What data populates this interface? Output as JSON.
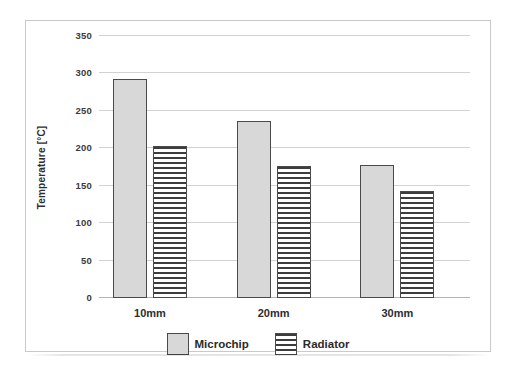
{
  "chart_data": {
    "type": "bar",
    "title": "",
    "xlabel": "",
    "ylabel": "Temperature [°C]",
    "categories": [
      "10mm",
      "20mm",
      "30mm"
    ],
    "series": [
      {
        "name": "Microchip",
        "values": [
          292,
          236,
          178
        ],
        "fill": "stipple-dots",
        "color": "#d8d8d8"
      },
      {
        "name": "Radiator",
        "values": [
          203,
          177,
          143
        ],
        "fill": "horizontal-lines",
        "color": "#ffffff"
      }
    ],
    "ylim": [
      0,
      350
    ],
    "yticks": [
      0,
      50,
      100,
      150,
      200,
      250,
      300,
      350
    ],
    "ytick_labels": [
      "0",
      "50",
      "100",
      "150",
      "200",
      "250",
      "300",
      "350"
    ],
    "grid": "horizontal",
    "legend_position": "bottom-center"
  },
  "axis": {
    "y_title": "Temperature [°C]"
  },
  "legend": {
    "items": [
      {
        "label": "Microchip"
      },
      {
        "label": "Radiator"
      }
    ]
  }
}
